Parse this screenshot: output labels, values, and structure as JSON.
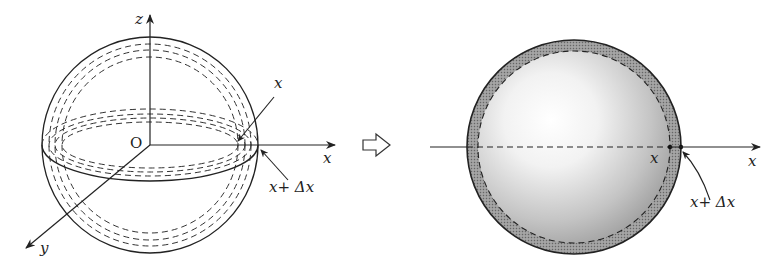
{
  "figure": {
    "left_panel": {
      "description": "Sphere with concentric dashed shells and 3D axes",
      "labels": {
        "z_axis": "z",
        "y_axis": "y",
        "x_axis": "x",
        "x_oblique": "x",
        "origin": "O",
        "shell_outer": "x+ Δx"
      }
    },
    "transition_arrow": "⇨",
    "right_panel": {
      "description": "Shaded sphere with thin spherical shell between x and x+Δx",
      "labels": {
        "x_axis": "x",
        "inner_radius": "x",
        "shell_outer": "x+ Δx"
      }
    },
    "colors": {
      "line": "#222222",
      "shell_fill": "#8a8a8a",
      "sphere_highlight": "#ffffff",
      "sphere_shadow": "#9a9a9a"
    }
  }
}
